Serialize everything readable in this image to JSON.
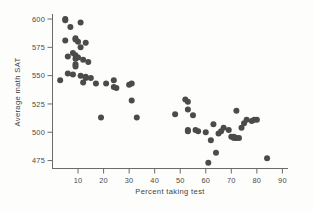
{
  "chart_data": {
    "type": "scatter",
    "title": "",
    "xlabel": "Percent taking test",
    "ylabel": "Average math SAT",
    "xlim": [
      0,
      92
    ],
    "ylim": [
      468,
      604
    ],
    "xticks": [
      10,
      20,
      30,
      40,
      50,
      60,
      70,
      80,
      90
    ],
    "xtick_labels": [
      "10",
      "20",
      "30",
      "40",
      "50",
      "60",
      "70",
      "80",
      "90"
    ],
    "yticks": [
      475,
      500,
      525,
      550,
      575,
      600
    ],
    "ytick_labels": [
      "475",
      "500",
      "525",
      "550",
      "575",
      "600"
    ],
    "grid": false,
    "legend": false,
    "marker": "filled-circle",
    "marker_color": "#4b4b4b",
    "marker_size": 3.0,
    "x": [
      5,
      5,
      7,
      11,
      5,
      6,
      9,
      9,
      10,
      11,
      13,
      3,
      8,
      9,
      9,
      9,
      10,
      12,
      14,
      6,
      8,
      9,
      11,
      12,
      13,
      13,
      15,
      17,
      19,
      21,
      24,
      24,
      25,
      30,
      31,
      31,
      33,
      48,
      52,
      53,
      53,
      53,
      53,
      55,
      56,
      57,
      60,
      61,
      62,
      63,
      64,
      65,
      66,
      67,
      69,
      70,
      71,
      71,
      72,
      72,
      73,
      74,
      75,
      76,
      78,
      79,
      80,
      84
    ],
    "y": [
      600,
      599,
      593,
      597,
      581,
      567,
      583,
      582,
      580,
      575,
      579,
      546,
      570,
      568,
      565,
      560,
      566,
      564,
      562,
      552,
      551,
      558,
      550,
      544,
      549,
      548,
      548,
      543,
      513,
      543,
      546,
      540,
      539,
      542,
      528,
      543,
      513,
      516,
      529,
      527,
      520,
      502,
      501,
      515,
      502,
      501,
      500,
      473,
      493,
      507,
      482,
      499,
      501,
      504,
      502,
      496,
      495,
      496,
      495,
      519,
      495,
      504,
      508,
      511,
      510,
      511,
      511,
      477
    ],
    "n_points": 68
  },
  "credit": {
    "text": "© Cengage Learning"
  }
}
